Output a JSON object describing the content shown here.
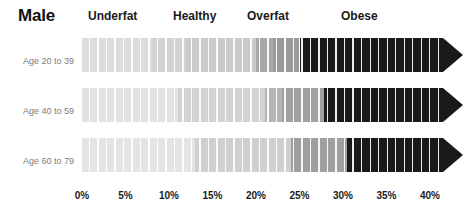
{
  "header": {
    "title": "Male"
  },
  "categories": [
    {
      "label": "Underfat",
      "x": 88
    },
    {
      "label": "Healthy",
      "x": 173
    },
    {
      "label": "Overfat",
      "x": 247
    },
    {
      "label": "Obese",
      "x": 341
    }
  ],
  "rows": [
    {
      "label": "Age 20 to 39",
      "top": 38,
      "segments": [
        {
          "from": 0.0,
          "to": 8.0,
          "color": "#dcdcdc"
        },
        {
          "from": 8.0,
          "to": 12.0,
          "color": "#d2d2d2"
        },
        {
          "from": 12.0,
          "to": 20.0,
          "color": "#cacaca"
        },
        {
          "from": 20.0,
          "to": 22.0,
          "color": "#a8a8a8"
        },
        {
          "from": 22.0,
          "to": 25.0,
          "color": "#9a9a9a"
        },
        {
          "from": 25.0,
          "to": 41.5,
          "color": "#1a1a1a"
        }
      ]
    },
    {
      "label": "Age 40 to 59",
      "top": 88,
      "segments": [
        {
          "from": 0.0,
          "to": 11.0,
          "color": "#e2e2e2"
        },
        {
          "from": 11.0,
          "to": 21.0,
          "color": "#d2d2d2"
        },
        {
          "from": 21.0,
          "to": 23.0,
          "color": "#b4b4b4"
        },
        {
          "from": 23.0,
          "to": 27.8,
          "color": "#a0a0a0"
        },
        {
          "from": 27.8,
          "to": 41.5,
          "color": "#1a1a1a"
        }
      ]
    },
    {
      "label": "Age 60 to 79",
      "top": 138,
      "segments": [
        {
          "from": 0.0,
          "to": 13.0,
          "color": "#e4e4e4"
        },
        {
          "from": 13.0,
          "to": 24.0,
          "color": "#d0d0d0"
        },
        {
          "from": 24.0,
          "to": 30.5,
          "color": "#9f9f9f"
        },
        {
          "from": 30.5,
          "to": 41.5,
          "color": "#1a1a1a"
        }
      ]
    }
  ],
  "axis": {
    "ticks": [
      "0%",
      "5%",
      "10%",
      "15%",
      "20%",
      "25%",
      "30%",
      "35%",
      "40%"
    ],
    "values": [
      0,
      5,
      10,
      15,
      20,
      25,
      30,
      35,
      40
    ]
  },
  "chart_data": {
    "type": "bar",
    "title": "Male",
    "xlabel": "Body fat percentage",
    "ylabel": "",
    "xlim": [
      0,
      41.5
    ],
    "grid": false,
    "legend_position": "top",
    "categories": [
      "Underfat",
      "Healthy",
      "Overfat",
      "Obese"
    ],
    "tick_labels": [
      "0%",
      "5%",
      "10%",
      "15%",
      "20%",
      "25%",
      "30%",
      "35%",
      "40%"
    ],
    "series": [
      {
        "name": "Age 20 to 39",
        "ranges": [
          {
            "category": "Underfat",
            "from": 0.0,
            "to": 8.0
          },
          {
            "category": "Healthy",
            "from": 8.0,
            "to": 20.0
          },
          {
            "category": "Overfat",
            "from": 20.0,
            "to": 25.0
          },
          {
            "category": "Obese",
            "from": 25.0,
            "to": 41.5
          }
        ]
      },
      {
        "name": "Age 40 to 59",
        "ranges": [
          {
            "category": "Underfat",
            "from": 0.0,
            "to": 11.0
          },
          {
            "category": "Healthy",
            "from": 11.0,
            "to": 21.0
          },
          {
            "category": "Overfat",
            "from": 21.0,
            "to": 27.8
          },
          {
            "category": "Obese",
            "from": 27.8,
            "to": 41.5
          }
        ]
      },
      {
        "name": "Age 60 to 79",
        "ranges": [
          {
            "category": "Underfat",
            "from": 0.0,
            "to": 13.0
          },
          {
            "category": "Healthy",
            "from": 13.0,
            "to": 24.0
          },
          {
            "category": "Overfat",
            "from": 24.0,
            "to": 30.5
          },
          {
            "category": "Obese",
            "from": 30.5,
            "to": 41.5
          }
        ]
      }
    ]
  },
  "colors": {
    "underfat": "#dcdcdc",
    "healthy": "#d0d0d0",
    "overfat": "#9f9f9f",
    "obese": "#1a1a1a",
    "label_gray": "#7d7d7d",
    "text_dark": "#1a1a1a"
  }
}
